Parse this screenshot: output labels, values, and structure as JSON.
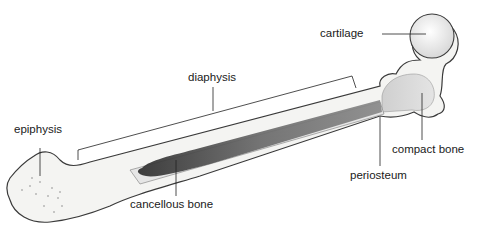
{
  "diagram": {
    "labels": {
      "cartilage": "cartilage",
      "diaphysis": "diaphysis",
      "epiphysis": "epiphysis",
      "compact_bone": "compact bone",
      "periosteum": "periosteum",
      "cancellous_bone": "cancellous bone"
    },
    "colors": {
      "bone_fill": "#f2f2f0",
      "bone_outline": "#3a3a3a",
      "marrow_dark": "#4a4a4a",
      "leader_line": "#222222"
    }
  }
}
